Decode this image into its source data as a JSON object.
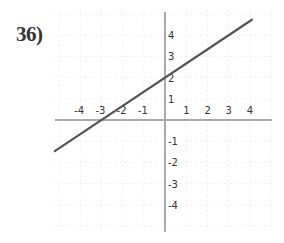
{
  "problem": {
    "number_label": "36)"
  },
  "chart_data": {
    "type": "line",
    "title": "",
    "xlabel": "",
    "ylabel": "",
    "xlim": [
      -5,
      5
    ],
    "ylim": [
      -5,
      5
    ],
    "grid": true,
    "x_ticks": [
      "-4",
      "-3",
      "-2",
      "-1",
      "1",
      "2",
      "3",
      "4"
    ],
    "y_ticks": [
      "4",
      "3",
      "2",
      "1",
      "-1",
      "-2",
      "-3",
      "-4"
    ],
    "series": [
      {
        "name": "line",
        "equation": "y = (2/3)x + 2",
        "slope": 0.6667,
        "y_intercept": 2,
        "x_intercept": -3,
        "x": [
          -5.2,
          4.1
        ],
        "y": [
          -1.47,
          4.73
        ]
      }
    ],
    "colors": {
      "line": "#555555",
      "axes": "#aaaaaa",
      "grid": "#eeeeee",
      "text": "#333333"
    }
  }
}
